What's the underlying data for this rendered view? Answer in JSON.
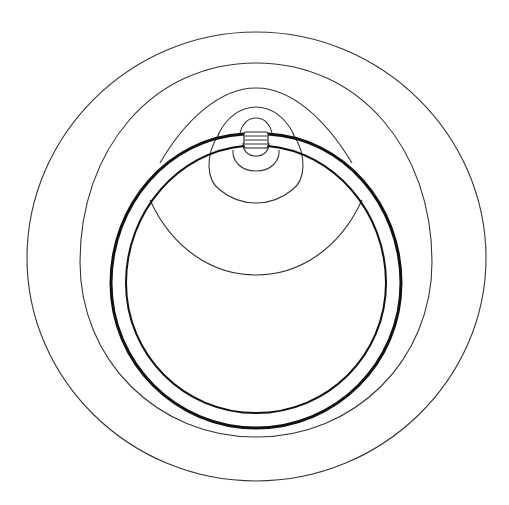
{
  "diagram": {
    "type": "contour-diagram",
    "background": "#ffffff",
    "line_color": "#2a2a2a",
    "ring_color": "#111111",
    "labels": []
  }
}
